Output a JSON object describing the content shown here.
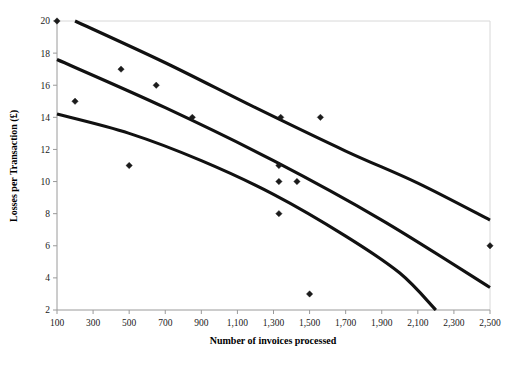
{
  "chart_data": {
    "type": "scatter",
    "title": "",
    "xlabel": "Number of invoices processed",
    "ylabel": "Losses per Transaction (£)",
    "xlim": [
      100,
      2500
    ],
    "ylim": [
      2,
      20
    ],
    "xticks": [
      100,
      300,
      500,
      700,
      900,
      1100,
      1300,
      1500,
      1700,
      1900,
      2100,
      2300,
      2500
    ],
    "xtick_labels": [
      "100",
      "300",
      "500",
      "700",
      "900",
      "1,100",
      "1,300",
      "1,500",
      "1,700",
      "1,900",
      "2,100",
      "2,300",
      "2,500"
    ],
    "yticks": [
      2,
      4,
      6,
      8,
      10,
      12,
      14,
      16,
      18,
      20
    ],
    "ytick_labels": [
      "2",
      "4",
      "6",
      "8",
      "10",
      "12",
      "14",
      "16",
      "18",
      "20"
    ],
    "grid": false,
    "legend": "none",
    "point_color": "#1b1b1b",
    "line_color": "#111111",
    "points": [
      {
        "x": 100,
        "y": 20
      },
      {
        "x": 200,
        "y": 15
      },
      {
        "x": 455,
        "y": 17
      },
      {
        "x": 500,
        "y": 11
      },
      {
        "x": 650,
        "y": 16
      },
      {
        "x": 850,
        "y": 14
      },
      {
        "x": 1330,
        "y": 11
      },
      {
        "x": 1330,
        "y": 10
      },
      {
        "x": 1340,
        "y": 14
      },
      {
        "x": 1330,
        "y": 8
      },
      {
        "x": 1430,
        "y": 10
      },
      {
        "x": 1500,
        "y": 3
      },
      {
        "x": 1560,
        "y": 14
      },
      {
        "x": 2500,
        "y": 6
      }
    ],
    "series": [
      {
        "name": "upper-confidence-band",
        "type": "line",
        "points": [
          {
            "x": 200,
            "y": 20.0
          },
          {
            "x": 700,
            "y": 17.4
          },
          {
            "x": 1200,
            "y": 14.6
          },
          {
            "x": 1700,
            "y": 11.9
          },
          {
            "x": 2100,
            "y": 9.9
          },
          {
            "x": 2500,
            "y": 7.6
          }
        ]
      },
      {
        "name": "regression-line",
        "type": "line",
        "points": [
          {
            "x": 100,
            "y": 17.6
          },
          {
            "x": 700,
            "y": 14.6
          },
          {
            "x": 1300,
            "y": 11.3
          },
          {
            "x": 1900,
            "y": 7.6
          },
          {
            "x": 2500,
            "y": 3.4
          }
        ]
      },
      {
        "name": "lower-confidence-band",
        "type": "line",
        "points": [
          {
            "x": 100,
            "y": 14.2
          },
          {
            "x": 500,
            "y": 13.0
          },
          {
            "x": 900,
            "y": 11.3
          },
          {
            "x": 1300,
            "y": 9.2
          },
          {
            "x": 1700,
            "y": 6.6
          },
          {
            "x": 2000,
            "y": 4.3
          },
          {
            "x": 2200,
            "y": 2.0
          }
        ]
      }
    ]
  },
  "caption": {
    "ghost_text": ""
  }
}
